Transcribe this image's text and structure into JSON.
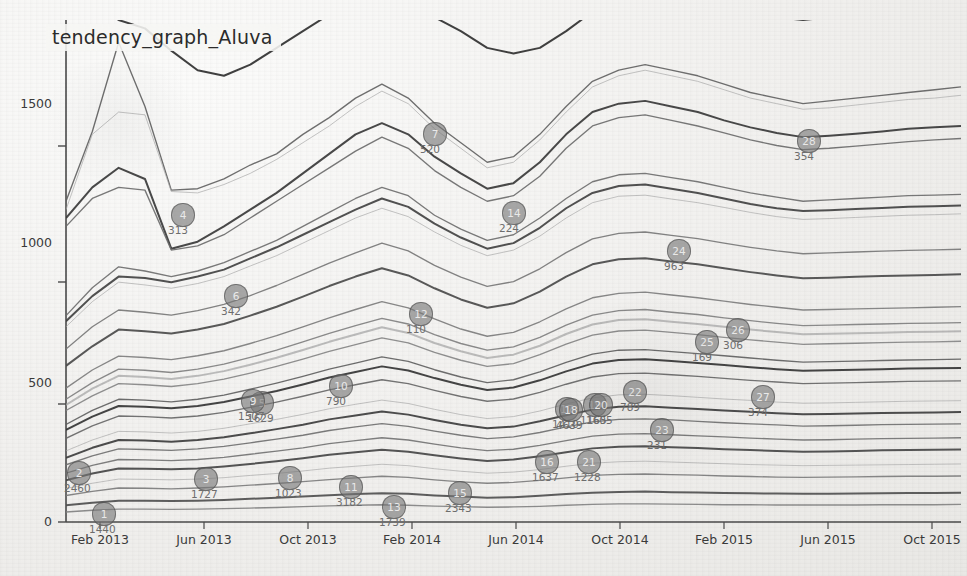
{
  "chart_data": {
    "type": "line",
    "title": "tendency_graph_Aluva",
    "xlabel": "",
    "ylabel": "",
    "grid": false,
    "legend": "none",
    "xlim": [
      "Feb 2013",
      "Dec 2015"
    ],
    "ylim": [
      0,
      1800
    ],
    "yticks": [
      0,
      500,
      1000,
      1500
    ],
    "xticks": [
      "Feb 2013",
      "Jun 2013",
      "Oct 2013",
      "Feb 2014",
      "Jun 2014",
      "Oct 2014",
      "Feb 2015",
      "Jun 2015",
      "Oct 2015"
    ],
    "x": [
      "Feb 2013",
      "Mar 2013",
      "Apr 2013",
      "May 2013",
      "Jun 2013",
      "Jul 2013",
      "Aug 2013",
      "Sep 2013",
      "Oct 2013",
      "Nov 2013",
      "Dec 2013",
      "Jan 2014",
      "Feb 2014",
      "Mar 2014",
      "Apr 2014",
      "May 2014",
      "Jun 2014",
      "Jul 2014",
      "Aug 2014",
      "Sep 2014",
      "Oct 2014",
      "Nov 2014",
      "Dec 2014",
      "Jan 2015",
      "Feb 2015",
      "Mar 2015",
      "Apr 2015",
      "May 2015",
      "Jun 2015",
      "Jul 2015",
      "Aug 2015",
      "Sep 2015",
      "Oct 2015",
      "Nov 2015",
      "Dec 2015"
    ],
    "series": [
      {
        "name": "s1",
        "values": [
          1960,
          1860,
          1800,
          1770,
          1690,
          1620,
          1600,
          1640,
          1700,
          1760,
          1820,
          1860,
          1900,
          1870,
          1810,
          1760,
          1700,
          1680,
          1700,
          1760,
          1830,
          1880,
          1900,
          1880,
          1860,
          1840,
          1820,
          1810,
          1800,
          1810,
          1820,
          1830,
          1840,
          1840,
          1850
        ]
      },
      {
        "name": "s2",
        "values": [
          1150,
          1400,
          1720,
          1490,
          1190,
          1195,
          1230,
          1280,
          1320,
          1390,
          1450,
          1520,
          1570,
          1520,
          1430,
          1360,
          1290,
          1310,
          1390,
          1490,
          1580,
          1620,
          1640,
          1620,
          1600,
          1570,
          1540,
          1520,
          1500,
          1510,
          1520,
          1530,
          1540,
          1550,
          1560
        ]
      },
      {
        "name": "s3",
        "values": [
          1120,
          1390,
          1470,
          1460,
          1185,
          1180,
          1210,
          1250,
          1300,
          1360,
          1420,
          1490,
          1545,
          1500,
          1410,
          1340,
          1270,
          1290,
          1370,
          1470,
          1560,
          1600,
          1620,
          1600,
          1580,
          1550,
          1520,
          1500,
          1480,
          1485,
          1495,
          1505,
          1515,
          1520,
          1530
        ]
      },
      {
        "name": "s4",
        "values": [
          1090,
          1200,
          1270,
          1230,
          980,
          1005,
          1060,
          1120,
          1180,
          1250,
          1320,
          1390,
          1430,
          1390,
          1310,
          1250,
          1195,
          1215,
          1290,
          1390,
          1470,
          1500,
          1510,
          1490,
          1470,
          1440,
          1415,
          1395,
          1380,
          1385,
          1392,
          1400,
          1410,
          1415,
          1420
        ]
      },
      {
        "name": "s5",
        "values": [
          1060,
          1160,
          1200,
          1190,
          975,
          990,
          1030,
          1090,
          1150,
          1210,
          1270,
          1330,
          1380,
          1340,
          1260,
          1200,
          1150,
          1170,
          1240,
          1340,
          1420,
          1450,
          1460,
          1440,
          1420,
          1395,
          1370,
          1350,
          1335,
          1340,
          1348,
          1356,
          1364,
          1370,
          1375
        ]
      },
      {
        "name": "s6",
        "values": [
          740,
          840,
          915,
          900,
          880,
          900,
          930,
          970,
          1010,
          1060,
          1110,
          1160,
          1200,
          1170,
          1100,
          1050,
          1010,
          1030,
          1090,
          1160,
          1220,
          1245,
          1250,
          1235,
          1220,
          1200,
          1180,
          1165,
          1150,
          1155,
          1160,
          1165,
          1170,
          1172,
          1175
        ]
      },
      {
        "name": "s7",
        "values": [
          720,
          810,
          880,
          875,
          860,
          880,
          905,
          945,
          985,
          1030,
          1075,
          1120,
          1160,
          1130,
          1070,
          1020,
          980,
          1000,
          1055,
          1125,
          1180,
          1205,
          1210,
          1195,
          1180,
          1160,
          1140,
          1125,
          1115,
          1118,
          1122,
          1126,
          1130,
          1132,
          1135
        ]
      },
      {
        "name": "s8",
        "values": [
          700,
          790,
          860,
          850,
          838,
          855,
          880,
          918,
          955,
          1000,
          1045,
          1090,
          1125,
          1095,
          1040,
          992,
          955,
          975,
          1025,
          1090,
          1145,
          1168,
          1172,
          1158,
          1145,
          1128,
          1110,
          1095,
          1085,
          1088,
          1092,
          1096,
          1100,
          1102,
          1105
        ]
      },
      {
        "name": "s9",
        "values": [
          620,
          700,
          760,
          752,
          742,
          758,
          780,
          812,
          848,
          888,
          928,
          965,
          1000,
          972,
          920,
          878,
          845,
          862,
          908,
          966,
          1015,
          1035,
          1040,
          1028,
          1016,
          1000,
          985,
          972,
          962,
          965,
          968,
          971,
          974,
          976,
          978
        ]
      },
      {
        "name": "s10",
        "values": [
          560,
          630,
          690,
          684,
          676,
          690,
          710,
          740,
          772,
          808,
          846,
          880,
          910,
          884,
          838,
          798,
          768,
          784,
          826,
          880,
          924,
          942,
          946,
          934,
          924,
          910,
          896,
          884,
          874,
          876,
          879,
          882,
          884,
          886,
          888
        ]
      },
      {
        "name": "s11",
        "values": [
          480,
          545,
          595,
          590,
          582,
          596,
          614,
          640,
          668,
          700,
          732,
          762,
          790,
          768,
          728,
          692,
          666,
          680,
          718,
          764,
          804,
          820,
          824,
          814,
          804,
          792,
          780,
          770,
          760,
          762,
          764,
          766,
          768,
          770,
          772
        ]
      },
      {
        "name": "s12",
        "values": [
          440,
          500,
          548,
          544,
          536,
          548,
          566,
          590,
          616,
          646,
          676,
          704,
          730,
          710,
          672,
          640,
          616,
          628,
          662,
          706,
          742,
          758,
          762,
          752,
          744,
          732,
          722,
          712,
          704,
          706,
          708,
          710,
          712,
          713,
          715
        ]
      },
      {
        "name": "s13",
        "values": [
          420,
          478,
          524,
          520,
          513,
          524,
          541,
          564,
          589,
          617,
          646,
          672,
          698,
          678,
          642,
          612,
          588,
          600,
          632,
          674,
          708,
          724,
          727,
          718,
          710,
          700,
          690,
          681,
          673,
          675,
          677,
          679,
          681,
          682,
          684
        ]
      },
      {
        "name": "s14",
        "values": [
          400,
          452,
          496,
          492,
          486,
          496,
          512,
          534,
          558,
          584,
          612,
          636,
          660,
          642,
          608,
          580,
          558,
          568,
          600,
          638,
          670,
          685,
          688,
          680,
          672,
          662,
          653,
          645,
          637,
          639,
          641,
          643,
          645,
          646,
          648
        ]
      },
      {
        "name": "s15",
        "values": [
          350,
          400,
          440,
          437,
          431,
          440,
          455,
          476,
          498,
          522,
          548,
          570,
          592,
          576,
          546,
          520,
          500,
          510,
          538,
          572,
          602,
          616,
          618,
          611,
          604,
          596,
          588,
          580,
          573,
          575,
          577,
          579,
          581,
          582,
          584
        ]
      },
      {
        "name": "s16",
        "values": [
          330,
          378,
          416,
          413,
          408,
          416,
          430,
          450,
          470,
          493,
          518,
          538,
          558,
          543,
          516,
          492,
          473,
          482,
          508,
          540,
          568,
          581,
          584,
          577,
          570,
          563,
          555,
          548,
          542,
          544,
          546,
          548,
          550,
          551,
          552
        ]
      },
      {
        "name": "s17",
        "values": [
          300,
          345,
          380,
          378,
          373,
          380,
          393,
          411,
          430,
          451,
          474,
          492,
          510,
          496,
          472,
          450,
          433,
          441,
          465,
          494,
          520,
          532,
          534,
          528,
          522,
          515,
          508,
          502,
          496,
          498,
          500,
          502,
          504,
          505,
          506
        ]
      },
      {
        "name": "s18",
        "values": [
          255,
          294,
          325,
          323,
          319,
          325,
          336,
          352,
          368,
          386,
          406,
          422,
          437,
          425,
          404,
          385,
          371,
          378,
          398,
          423,
          445,
          456,
          458,
          453,
          447,
          441,
          436,
          430,
          426,
          427,
          429,
          431,
          433,
          434,
          435
        ]
      },
      {
        "name": "s19",
        "values": [
          230,
          266,
          294,
          292,
          288,
          294,
          304,
          318,
          333,
          349,
          368,
          382,
          396,
          385,
          366,
          349,
          336,
          342,
          361,
          383,
          403,
          413,
          415,
          410,
          405,
          400,
          395,
          390,
          386,
          387,
          389,
          391,
          392,
          393,
          394
        ]
      },
      {
        "name": "s20",
        "values": [
          205,
          237,
          262,
          260,
          257,
          262,
          271,
          284,
          297,
          311,
          328,
          341,
          353,
          343,
          326,
          311,
          299,
          305,
          321,
          341,
          359,
          368,
          370,
          366,
          361,
          356,
          352,
          348,
          344,
          345,
          347,
          349,
          350,
          351,
          352
        ]
      },
      {
        "name": "s21",
        "values": [
          175,
          203,
          224,
          223,
          220,
          224,
          232,
          243,
          254,
          266,
          281,
          292,
          302,
          294,
          279,
          266,
          256,
          261,
          275,
          292,
          308,
          315,
          317,
          313,
          309,
          305,
          301,
          297,
          294,
          295,
          297,
          299,
          300,
          301,
          302
        ]
      },
      {
        "name": "s22",
        "values": [
          150,
          174,
          192,
          191,
          189,
          192,
          199,
          208,
          218,
          229,
          241,
          250,
          259,
          252,
          239,
          228,
          219,
          224,
          236,
          250,
          264,
          270,
          272,
          268,
          265,
          261,
          258,
          255,
          252,
          253,
          255,
          257,
          258,
          259,
          260
        ]
      },
      {
        "name": "s23",
        "values": [
          120,
          139,
          154,
          153,
          151,
          154,
          159,
          167,
          174,
          183,
          193,
          200,
          207,
          202,
          191,
          182,
          175,
          179,
          188,
          200,
          211,
          216,
          218,
          215,
          212,
          209,
          206,
          204,
          202,
          203,
          204,
          205,
          206,
          207,
          208
        ]
      },
      {
        "name": "s24",
        "values": [
          95,
          110,
          122,
          121,
          119,
          122,
          126,
          132,
          138,
          145,
          152,
          158,
          164,
          160,
          151,
          144,
          139,
          142,
          149,
          158,
          167,
          171,
          172,
          170,
          168,
          165,
          163,
          161,
          160,
          161,
          162,
          163,
          164,
          164,
          165
        ]
      },
      {
        "name": "s25",
        "values": [
          60,
          69,
          76,
          76,
          75,
          76,
          79,
          83,
          87,
          91,
          96,
          100,
          103,
          101,
          95,
          91,
          87,
          89,
          94,
          100,
          105,
          108,
          109,
          107,
          106,
          104,
          103,
          102,
          101,
          101,
          102,
          103,
          104,
          104,
          105
        ]
      },
      {
        "name": "s26",
        "values": [
          36,
          42,
          46,
          46,
          45,
          46,
          48,
          50,
          52,
          55,
          58,
          60,
          62,
          60,
          57,
          55,
          53,
          54,
          56,
          60,
          63,
          65,
          65,
          64,
          63,
          62,
          62,
          61,
          61,
          61,
          61,
          62,
          62,
          62,
          63
        ]
      }
    ],
    "annotations": [
      {
        "id": "1",
        "label": "1440"
      },
      {
        "id": "2",
        "label": "2460"
      },
      {
        "id": "3",
        "label": "1727"
      },
      {
        "id": "4",
        "label": "313"
      },
      {
        "id": "5",
        "label": "1629"
      },
      {
        "id": "6",
        "label": "342"
      },
      {
        "id": "7",
        "label": "520"
      },
      {
        "id": "8",
        "label": "1023"
      },
      {
        "id": "9",
        "label": "1507"
      },
      {
        "id": "10",
        "label": "790"
      },
      {
        "id": "11",
        "label": "3182"
      },
      {
        "id": "12",
        "label": "110"
      },
      {
        "id": "13",
        "label": "1739"
      },
      {
        "id": "14",
        "label": "224"
      },
      {
        "id": "15",
        "label": "2343"
      },
      {
        "id": "16",
        "label": "1637"
      },
      {
        "id": "17",
        "label": "1410"
      },
      {
        "id": "18",
        "label": "4639"
      },
      {
        "id": "19",
        "label": "1165"
      },
      {
        "id": "20",
        "label": "1605"
      },
      {
        "id": "21",
        "label": "1228"
      },
      {
        "id": "22",
        "label": "789"
      },
      {
        "id": "23",
        "label": "231"
      },
      {
        "id": "24",
        "label": "963"
      },
      {
        "id": "25",
        "label": "169"
      },
      {
        "id": "26",
        "label": "306"
      },
      {
        "id": "27",
        "label": "374"
      },
      {
        "id": "28",
        "label": "354"
      }
    ]
  }
}
